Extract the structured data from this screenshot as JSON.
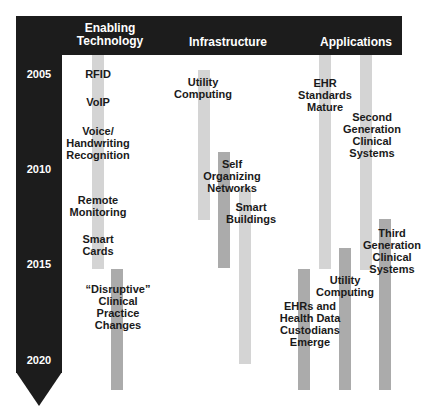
{
  "columns": [
    {
      "id": "enabling",
      "title_line1": "Enabling",
      "title_line2": "Technology"
    },
    {
      "id": "infrastructure",
      "title": "Infrastructure"
    },
    {
      "id": "applications",
      "title": "Applications"
    }
  ],
  "timeline": {
    "years": [
      "2005",
      "2010",
      "2015",
      "2020"
    ]
  },
  "items": {
    "rfid": "RFID",
    "voip": "VoIP",
    "voice_1": "Voice/",
    "voice_2": "Handwriting",
    "voice_3": "Recognition",
    "remote_1": "Remote",
    "remote_2": "Monitoring",
    "smart_cards_1": "Smart",
    "smart_cards_2": "Cards",
    "disruptive_1": "“Disruptive”",
    "disruptive_2": "Clinical",
    "disruptive_3": "Practice",
    "disruptive_4": "Changes",
    "utility_infra_1": "Utility",
    "utility_infra_2": "Computing",
    "self_org_1": "Self",
    "self_org_2": "Organizing",
    "self_org_3": "Networks",
    "smart_bld_1": "Smart",
    "smart_bld_2": "Buildings",
    "ehr_std_1": "EHR",
    "ehr_std_2": "Standards",
    "ehr_std_3": "Mature",
    "second_gen_1": "Second",
    "second_gen_2": "Generation",
    "second_gen_3": "Clinical",
    "second_gen_4": "Systems",
    "third_gen_1": "Third",
    "third_gen_2": "Generation",
    "third_gen_3": "Clinical",
    "third_gen_4": "Systems",
    "utility_app_1": "Utility",
    "utility_app_2": "Computing",
    "ehrs_custodians_1": "EHRs and",
    "ehrs_custodians_2": "Health Data",
    "ehrs_custodians_3": "Custodians",
    "ehrs_custodians_4": "Emerge"
  },
  "colors": {
    "frame": "#1c1c1c",
    "bar_light": "#d4d4d4",
    "bar_mid": "#ababab",
    "text": "#1a1a1a"
  }
}
